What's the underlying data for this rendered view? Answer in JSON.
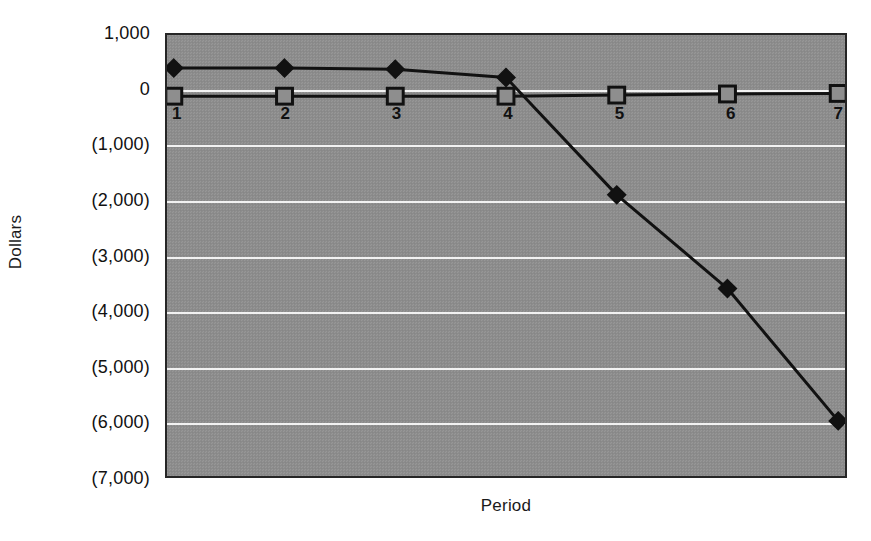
{
  "chart_data": {
    "type": "line",
    "title": "",
    "xlabel": "Period",
    "ylabel": "Dollars",
    "x": [
      1,
      2,
      3,
      4,
      5,
      6,
      7
    ],
    "x_tick_labels": [
      "1",
      "2",
      "3",
      "4",
      "5",
      "6",
      "7"
    ],
    "ylim": [
      -7000,
      1000
    ],
    "y_ticks": [
      1000,
      0,
      -1000,
      -2000,
      -3000,
      -4000,
      -5000,
      -6000,
      -7000
    ],
    "y_tick_labels": [
      "1,000",
      "0",
      "(1,000)",
      "(2,000)",
      "(3,000)",
      "(4,000)",
      "(5,000)",
      "(6,000)",
      "(7,000)"
    ],
    "grid": true,
    "legend": "none",
    "series": [
      {
        "name": "series-diamond",
        "marker": "filled-diamond",
        "values": [
          400,
          400,
          380,
          230,
          -1900,
          -3600,
          -6000
        ]
      },
      {
        "name": "series-square",
        "marker": "open-square",
        "values": [
          -110,
          -110,
          -110,
          -110,
          -90,
          -70,
          -60
        ]
      }
    ],
    "colors": {
      "plot_background": "#8e8e8e",
      "gridline": "#f2f2f2",
      "series_line": "#111111",
      "axis_border": "#262626",
      "text": "#111111",
      "page_background": "#ffffff"
    }
  }
}
